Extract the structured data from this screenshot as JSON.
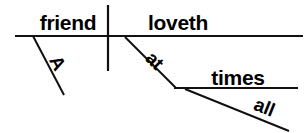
{
  "diagram": {
    "type": "reed-kellogg-sentence-diagram",
    "sentence": "A friend loveth at all times",
    "canvas": {
      "width": 307,
      "height": 133,
      "background": "#ffffff"
    },
    "ink_color": "#111111",
    "text_color": "#000000",
    "words": {
      "subject": {
        "text": "friend",
        "role": "subject",
        "x": 68,
        "y": 30,
        "font_size": 21,
        "rotation": 0
      },
      "verb": {
        "text": "loveth",
        "role": "verb",
        "x": 178,
        "y": 30,
        "font_size": 21,
        "rotation": 0
      },
      "article": {
        "text": "A",
        "role": "article-modifier-of-subject",
        "x": 52,
        "y": 66,
        "font_size": 19,
        "rotation": 62
      },
      "preposition": {
        "text": "at",
        "role": "preposition",
        "x": 150,
        "y": 65,
        "font_size": 19,
        "rotation": 45
      },
      "object_of_preposition": {
        "text": "times",
        "role": "object-of-preposition",
        "x": 238,
        "y": 85,
        "font_size": 21,
        "rotation": 0
      },
      "adjective": {
        "text": "all",
        "role": "adjective-modifier-of-times",
        "x": 262,
        "y": 113,
        "font_size": 19,
        "rotation": 22
      }
    },
    "lines": {
      "baseline": {
        "name": "main-baseline",
        "x1": 15,
        "y1": 36,
        "x2": 303,
        "y2": 36,
        "width": 2.2
      },
      "subject_verb_divider": {
        "name": "subject-verb-divider",
        "x1": 108,
        "y1": 5,
        "x2": 108,
        "y2": 71,
        "width": 2.2
      },
      "article_slant": {
        "name": "article-modifier-slant",
        "x1": 33,
        "y1": 36,
        "x2": 64,
        "y2": 95,
        "width": 2.0
      },
      "preposition_slant": {
        "name": "preposition-slant",
        "x1": 125,
        "y1": 37,
        "x2": 176,
        "y2": 88,
        "width": 2.0
      },
      "prep_object_line": {
        "name": "prepositional-object-line",
        "x1": 174,
        "y1": 88,
        "x2": 298,
        "y2": 88,
        "width": 2.0
      },
      "adjective_slant": {
        "name": "adjective-modifier-slant",
        "x1": 185,
        "y1": 89,
        "x2": 289,
        "y2": 131,
        "width": 2.0
      }
    }
  }
}
